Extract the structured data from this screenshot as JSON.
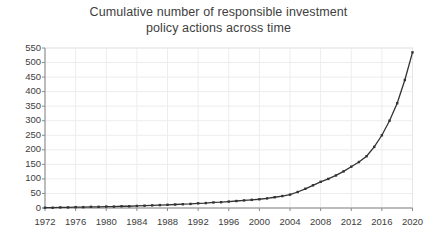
{
  "chart_data": {
    "type": "line",
    "title": "Cumulative number of responsible investment policy actions across time",
    "title_lines": [
      "Cumulative number of responsible investment",
      "policy actions across time"
    ],
    "xlabel": "",
    "ylabel": "",
    "xlim": [
      1972,
      2020
    ],
    "ylim": [
      0,
      550
    ],
    "yticks": [
      0,
      50,
      100,
      150,
      200,
      250,
      300,
      350,
      400,
      450,
      500,
      550
    ],
    "ytick_labels": [
      "0",
      "50",
      "100",
      "150",
      "200",
      "250",
      "300",
      "350",
      "400",
      "450",
      "500",
      "550"
    ],
    "xticks": [
      1972,
      1976,
      1980,
      1984,
      1988,
      1992,
      1996,
      2000,
      2004,
      2008,
      2012,
      2016,
      2020
    ],
    "xtick_labels": [
      "1972",
      "1976",
      "1980",
      "1984",
      "1988",
      "1992",
      "1996",
      "2000",
      "2004",
      "2008",
      "2012",
      "2016",
      "2020"
    ],
    "grid": true,
    "legend": false,
    "legend_position": "none",
    "line_color": "#333333",
    "grid_color": "#ededed",
    "marker": "square",
    "series": [
      {
        "name": "Cumulative policy actions",
        "x": [
          1972,
          1973,
          1974,
          1975,
          1976,
          1977,
          1978,
          1979,
          1980,
          1981,
          1982,
          1983,
          1984,
          1985,
          1986,
          1987,
          1988,
          1989,
          1990,
          1991,
          1992,
          1993,
          1994,
          1995,
          1996,
          1997,
          1998,
          1999,
          2000,
          2001,
          2002,
          2003,
          2004,
          2005,
          2006,
          2007,
          2008,
          2009,
          2010,
          2011,
          2012,
          2013,
          2014,
          2015,
          2016,
          2017,
          2018,
          2019,
          2020
        ],
        "values": [
          1,
          1,
          2,
          2,
          3,
          3,
          4,
          4,
          5,
          5,
          6,
          6,
          7,
          8,
          9,
          10,
          11,
          12,
          13,
          14,
          16,
          17,
          19,
          20,
          22,
          24,
          26,
          28,
          30,
          33,
          37,
          41,
          46,
          55,
          66,
          78,
          90,
          100,
          112,
          126,
          142,
          158,
          178,
          210,
          250,
          300,
          360,
          440,
          535
        ]
      }
    ]
  }
}
